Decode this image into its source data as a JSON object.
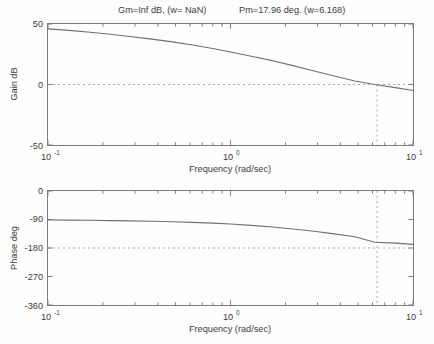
{
  "figure": {
    "title": "Gm=Inf dB, (w= NaN)    Pm=17.96 deg. (w=6.168)",
    "title_gain_part": "Gm=Inf dB, (w= NaN)",
    "title_phase_part": "Pm=17.96 deg. (w=6.168)",
    "background_color": "#fefefe",
    "axis_color": "#7c7c7c",
    "curve_color": "#6f6f6f",
    "reference_line_color": "#a8a8a8"
  },
  "chart_data": [
    {
      "type": "line",
      "name": "magnitude",
      "title": "Gm=Inf dB, (w= NaN)    Pm=17.96 deg. (w=6.168)",
      "xlabel": "Frequency (rad/sec)",
      "ylabel": "Gain dB",
      "xscale": "log",
      "xlim": [
        0.1,
        10
      ],
      "ylim": [
        -50,
        50
      ],
      "xticks": [
        0.1,
        1,
        10
      ],
      "xticklabels": [
        "10^-1",
        "10^0",
        "10^1"
      ],
      "yticks": [
        -50,
        0,
        50
      ],
      "yticklabels": [
        "-50",
        "0",
        "50"
      ],
      "grid": false,
      "reference_lines": [
        {
          "axis": "y",
          "value": 0,
          "style": "dotted",
          "label": "0 dB"
        },
        {
          "axis": "x",
          "value": 6.168,
          "style": "dotted",
          "label": "gain crossover"
        }
      ],
      "x": [
        0.1,
        0.13,
        0.17,
        0.22,
        0.28,
        0.37,
        0.48,
        0.62,
        0.8,
        1.0,
        1.3,
        1.7,
        2.2,
        2.8,
        3.7,
        4.8,
        6.168,
        8.0,
        10.0
      ],
      "y": [
        46.0,
        44.7,
        43.2,
        41.5,
        39.7,
        37.5,
        35.2,
        32.6,
        29.8,
        26.8,
        23.4,
        19.7,
        15.6,
        11.6,
        7.0,
        2.9,
        0.0,
        -2.6,
        -5.0
      ]
    },
    {
      "type": "line",
      "name": "phase",
      "title": "",
      "xlabel": "Frequency (rad/sec)",
      "ylabel": "Phase deg",
      "xscale": "log",
      "xlim": [
        0.1,
        10
      ],
      "ylim": [
        -360,
        0
      ],
      "xticks": [
        0.1,
        1,
        10
      ],
      "xticklabels": [
        "10^-1",
        "10^0",
        "10^1"
      ],
      "yticks": [
        0,
        -90,
        -180,
        -270,
        -360
      ],
      "yticklabels": [
        "0",
        "-90",
        "-180",
        "-270",
        "-360"
      ],
      "grid": false,
      "reference_lines": [
        {
          "axis": "y",
          "value": -180,
          "style": "dotted",
          "label": "-180 deg"
        },
        {
          "axis": "x",
          "value": 6.168,
          "style": "dotted",
          "label": "gain crossover"
        }
      ],
      "x": [
        0.1,
        0.13,
        0.17,
        0.22,
        0.28,
        0.37,
        0.48,
        0.62,
        0.8,
        1.0,
        1.3,
        1.7,
        2.2,
        2.8,
        3.7,
        4.8,
        6.168,
        8.0,
        10.0
      ],
      "y": [
        -91.5,
        -92.0,
        -92.6,
        -93.4,
        -94.3,
        -95.6,
        -97.1,
        -99.1,
        -101.5,
        -104.3,
        -108.4,
        -113.6,
        -119.9,
        -126.4,
        -135.3,
        -144.6,
        -162.04,
        -164.5,
        -168.5
      ]
    }
  ],
  "gain_panel": {
    "ylabel": "Gain dB",
    "xlabel": "Frequency (rad/sec)",
    "yticklabels": [
      "50",
      "0",
      "-50"
    ],
    "xticklabels": [
      "10^-1",
      "10^0",
      "10^1"
    ]
  },
  "phase_panel": {
    "ylabel": "Phase deg",
    "xlabel": "Frequency (rad/sec)",
    "yticklabels": [
      "0",
      "-90",
      "-180",
      "-270",
      "-360"
    ],
    "xticklabels": [
      "10^-1",
      "10^0",
      "10^1"
    ]
  }
}
